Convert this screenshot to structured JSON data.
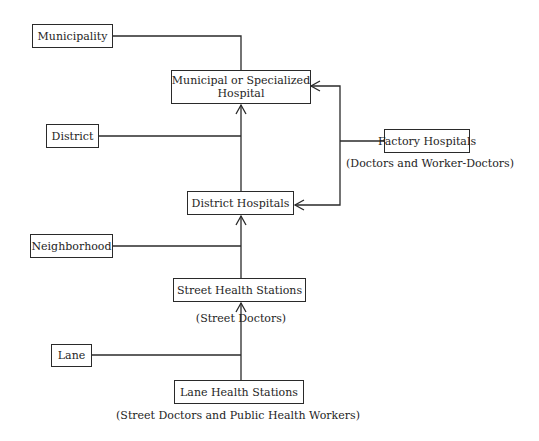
{
  "diagram": {
    "levels": [
      {
        "label": "Municipality"
      },
      {
        "label": "District"
      },
      {
        "label": "Neighborhood"
      },
      {
        "label": "Lane"
      }
    ],
    "facilities": {
      "municipal": {
        "line1": "Municipal or Specialized",
        "line2": "Hospital"
      },
      "district_hospitals": {
        "label": "District Hospitals"
      },
      "street_health": {
        "label": "Street Health Stations",
        "staff": "(Street Doctors)"
      },
      "lane_health": {
        "label": "Lane Health Stations",
        "staff": "(Street Doctors and Public Health Workers)"
      },
      "factory": {
        "label": "Factory Hospitals",
        "staff": "(Doctors and Worker-Doctors)"
      }
    },
    "colors": {
      "line": "#2a2a2a",
      "background": "#ffffff",
      "text": "#1e1e1e"
    }
  }
}
